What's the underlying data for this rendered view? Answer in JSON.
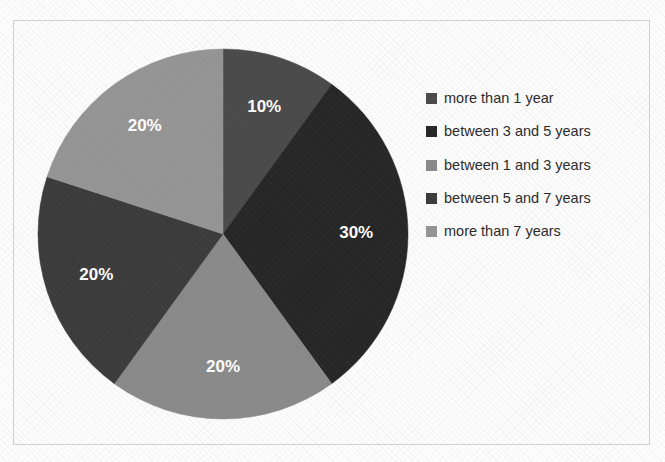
{
  "chart_data": {
    "type": "pie",
    "title": "",
    "subtitle": "",
    "xlabel": "",
    "ylabel": "",
    "grid": false,
    "legend_position": "right",
    "start_angle_deg": 0,
    "direction": "clockwise",
    "categories": [
      "more than 1 year",
      "between 3 and 5 years",
      "between 1 and 3 years",
      "between 5 and 7 years",
      "more than 7 years"
    ],
    "values": [
      10,
      30,
      20,
      20,
      20
    ],
    "value_unit": "%",
    "data_labels": [
      "10%",
      "30%",
      "20%",
      "20%",
      "20%"
    ],
    "data_label_color": "#ffffff",
    "slice_colors": [
      "#4a4a4a",
      "#262626",
      "#8a8a8a",
      "#3b3b3b",
      "#959595"
    ],
    "slices": [
      {
        "label": "more than 1 year",
        "value": 10,
        "display": "10%",
        "color": "#4a4a4a"
      },
      {
        "label": "between 3 and 5 years",
        "value": 30,
        "display": "30%",
        "color": "#262626"
      },
      {
        "label": "between 1 and 3 years",
        "value": 20,
        "display": "20%",
        "color": "#8a8a8a"
      },
      {
        "label": "between 5 and 7 years",
        "value": 20,
        "display": "20%",
        "color": "#3b3b3b"
      },
      {
        "label": "more than 7 years",
        "value": 20,
        "display": "20%",
        "color": "#959595"
      }
    ]
  },
  "legend": {
    "items": [
      {
        "label": "more than 1 year",
        "color": "#4a4a4a"
      },
      {
        "label": "between 3 and 5 years",
        "color": "#262626"
      },
      {
        "label": "between 1 and 3 years",
        "color": "#8a8a8a"
      },
      {
        "label": "between 5 and 7 years",
        "color": "#3b3b3b"
      },
      {
        "label": "more than 7 years",
        "color": "#959595"
      }
    ]
  },
  "style": {
    "frame_border_color": "#d2d2d4",
    "background_color": "#fcfcfc",
    "legend_text_color": "#2b2b2b"
  }
}
